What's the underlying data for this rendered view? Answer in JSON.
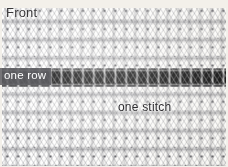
{
  "figure": {
    "width": 228,
    "height": 167
  },
  "labels": {
    "front": "Front",
    "one_row": "one row",
    "one_stitch": "one stitch"
  },
  "colors": {
    "yarn_light": "#fbfaf7",
    "yarn_shadow": "#6a6a72",
    "contrast_row": "#000000",
    "label_band": "#606064",
    "label_band_text": "#ffffff",
    "label_dark_text": "#2f2e31",
    "background": "#f3f0ea"
  },
  "fabric": {
    "stitch_columns": 21,
    "rows_visible": 9,
    "stitch_width_px": 10.8,
    "row_height_px": 18.2,
    "contrast_row_index": 4,
    "contrast_row_top_px": 68,
    "contrast_row_height_px": 19
  }
}
